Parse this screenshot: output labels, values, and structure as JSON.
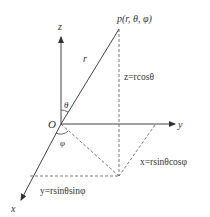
{
  "diagram": {
    "colors": {
      "line": "#444444",
      "text": "#333333",
      "background": "#ffffff"
    },
    "point_label": "p(r, θ, φ)",
    "origin_label": "O",
    "axes": {
      "x": "x",
      "y": "y",
      "z": "z"
    },
    "radius_label": "r",
    "angle_theta": "θ",
    "angle_phi": "φ",
    "equations": {
      "z": "z=rcosθ",
      "x": "x=rsinθcosφ",
      "y": "y=rsinθsinφ"
    }
  }
}
